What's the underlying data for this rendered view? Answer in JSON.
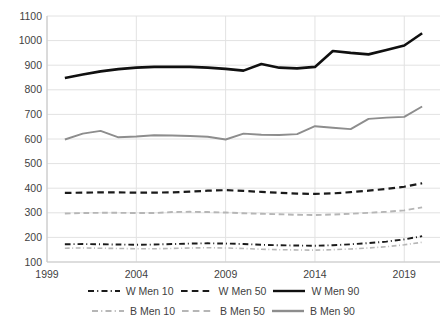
{
  "chart_data": {
    "type": "line",
    "title": "",
    "subtitle": "",
    "xlabel": "",
    "ylabel": "",
    "xlim": [
      1999,
      2021
    ],
    "ylim": [
      100,
      1100
    ],
    "ytick_values": [
      100,
      200,
      300,
      400,
      500,
      600,
      700,
      800,
      900,
      1000,
      1100
    ],
    "ytick_labels": [
      "100",
      "200",
      "300",
      "400",
      "500",
      "600",
      "700",
      "800",
      "900",
      "1000",
      "1100"
    ],
    "xtick_values": [
      1999,
      2004,
      2009,
      2014,
      2019
    ],
    "xtick_labels": [
      "1999",
      "2004",
      "2009",
      "2014",
      "2019"
    ],
    "grid": "horizontal-and-major-vertical",
    "legend_position": "bottom",
    "x": [
      2000,
      2001,
      2002,
      2003,
      2004,
      2005,
      2006,
      2007,
      2008,
      2009,
      2010,
      2011,
      2012,
      2013,
      2014,
      2015,
      2016,
      2017,
      2018,
      2019,
      2020
    ],
    "series": [
      {
        "name": "W Men 10",
        "color": "#1a1a1a",
        "dash": "dash-dot",
        "width": 1.9,
        "values": [
          172,
          173,
          172,
          171,
          170,
          171,
          173,
          175,
          176,
          175,
          173,
          170,
          168,
          167,
          166,
          168,
          172,
          177,
          183,
          192,
          205
        ]
      },
      {
        "name": "W Men 50",
        "color": "#1a1a1a",
        "dash": "dashed",
        "width": 2.2,
        "values": [
          381,
          382,
          383,
          383,
          382,
          382,
          383,
          386,
          390,
          392,
          389,
          385,
          381,
          378,
          377,
          379,
          384,
          390,
          397,
          406,
          420
        ]
      },
      {
        "name": "W Men 90",
        "color": "#101010",
        "dash": "solid",
        "width": 2.6,
        "values": [
          848,
          862,
          875,
          884,
          890,
          893,
          894,
          893,
          890,
          885,
          878,
          905,
          890,
          887,
          893,
          958,
          950,
          944,
          962,
          980,
          1030
        ]
      },
      {
        "name": "B Men 10",
        "color": "#b6b6b6",
        "dash": "dash-dot",
        "width": 1.6,
        "values": [
          156,
          157,
          156,
          155,
          154,
          154,
          155,
          157,
          158,
          157,
          155,
          152,
          150,
          149,
          148,
          150,
          153,
          157,
          162,
          170,
          180
        ]
      },
      {
        "name": "B Men 50",
        "color": "#b6b6b6",
        "dash": "dashed",
        "width": 1.9,
        "values": [
          297,
          299,
          300,
          300,
          299,
          299,
          303,
          304,
          303,
          301,
          298,
          296,
          294,
          292,
          291,
          293,
          296,
          300,
          304,
          310,
          322
        ]
      },
      {
        "name": "B Men 90",
        "color": "#8d8d8d",
        "dash": "solid",
        "width": 1.9,
        "values": [
          598,
          622,
          633,
          607,
          610,
          615,
          614,
          612,
          609,
          598,
          622,
          617,
          616,
          620,
          652,
          646,
          640,
          682,
          687,
          690,
          732
        ]
      }
    ],
    "legend_rows": [
      [
        {
          "label": "W Men 10",
          "color": "#1a1a1a",
          "dash": "dash-dot"
        },
        {
          "label": "W Men 50",
          "color": "#1a1a1a",
          "dash": "dashed"
        },
        {
          "label": "W Men 90",
          "color": "#101010",
          "dash": "solid"
        }
      ],
      [
        {
          "label": "B Men 10",
          "color": "#b6b6b6",
          "dash": "dash-dot"
        },
        {
          "label": "B Men 50",
          "color": "#b6b6b6",
          "dash": "dashed"
        },
        {
          "label": "B Men 90",
          "color": "#8d8d8d",
          "dash": "solid"
        }
      ]
    ],
    "style": {
      "grid_color": "#e2e2e2",
      "axis_color": "#c9c9c9",
      "background": "#ffffff",
      "text_color": "#3f3f3f"
    }
  }
}
